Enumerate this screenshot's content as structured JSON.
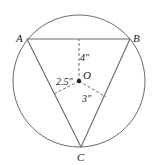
{
  "figure": {
    "type": "inscribed-triangle-diagram",
    "colors": {
      "stroke": "#6b6b6b",
      "text": "#222222",
      "background": "#ffffff"
    },
    "circle": {
      "cx": 79,
      "cy": 81,
      "r": 66
    },
    "center": {
      "label": "O",
      "x": 79,
      "y": 81
    },
    "vertices": [
      {
        "label": "A",
        "x": 27,
        "y": 39,
        "label_x": 16,
        "label_y": 42
      },
      {
        "label": "B",
        "x": 130,
        "y": 39,
        "label_x": 133,
        "label_y": 42
      },
      {
        "label": "C",
        "x": 81,
        "y": 147,
        "label_x": 77,
        "label_y": 161
      }
    ],
    "distances": [
      {
        "label": "4″",
        "to_side": "AB",
        "foot_x": 79,
        "foot_y": 39,
        "label_x": 80,
        "label_y": 61
      },
      {
        "label": "2.5″",
        "to_side": "AC",
        "foot_x": 54,
        "foot_y": 94,
        "label_x": 56,
        "label_y": 85
      },
      {
        "label": "3″",
        "to_side": "BC",
        "foot_x": 106,
        "foot_y": 97,
        "label_x": 82,
        "label_y": 102
      }
    ]
  }
}
